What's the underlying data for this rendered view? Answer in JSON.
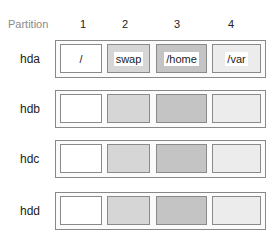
{
  "header": {
    "label": "Partition",
    "columns": [
      "1",
      "2",
      "3",
      "4"
    ]
  },
  "disks": [
    {
      "name": "hda",
      "partitions": [
        "/",
        "swap",
        "/home",
        "/var"
      ]
    },
    {
      "name": "hdb",
      "partitions": [
        "",
        "",
        "",
        ""
      ]
    },
    {
      "name": "hdc",
      "partitions": [
        "",
        "",
        "",
        ""
      ]
    },
    {
      "name": "hdd",
      "partitions": [
        "",
        "",
        "",
        ""
      ]
    }
  ],
  "colors": {
    "partition_1": "#ffffff",
    "partition_2": "#d6d6d6",
    "partition_3": "#c4c4c4",
    "partition_4": "#ececec",
    "border": "#888888"
  }
}
